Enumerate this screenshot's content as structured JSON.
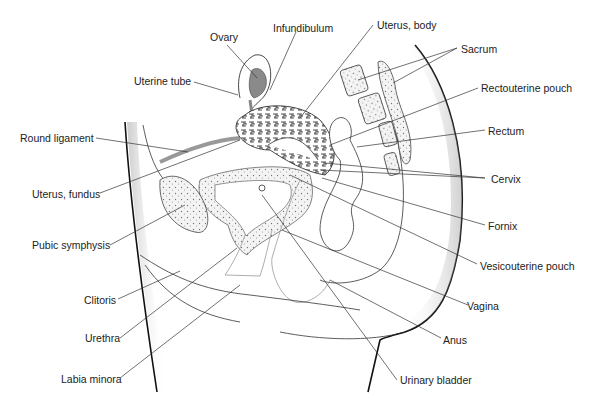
{
  "diagram": {
    "labels": {
      "ovary": "Ovary",
      "infundibulum": "Infundibulum",
      "uterus_body": "Uterus, body",
      "sacrum": "Sacrum",
      "uterine_tube": "Uterine tube",
      "rectouterine_pouch": "Rectouterine pouch",
      "round_ligament": "Round ligament",
      "rectum": "Rectum",
      "cervix": "Cervix",
      "uterus_fundus": "Uterus, fundus",
      "fornix": "Fornix",
      "pubic_symphysis": "Pubic symphysis",
      "vesicouterine_pouch": "Vesicouterine pouch",
      "clitoris": "Clitoris",
      "vagina": "Vagina",
      "urethra": "Urethra",
      "anus": "Anus",
      "labia_minora": "Labia minora",
      "urinary_bladder": "Urinary bladder"
    },
    "colors": {
      "line": "#333333",
      "ovary_fill": "#8a8a8a",
      "round_ligament": "#999999",
      "bone_fill": "#eeeeee"
    }
  }
}
